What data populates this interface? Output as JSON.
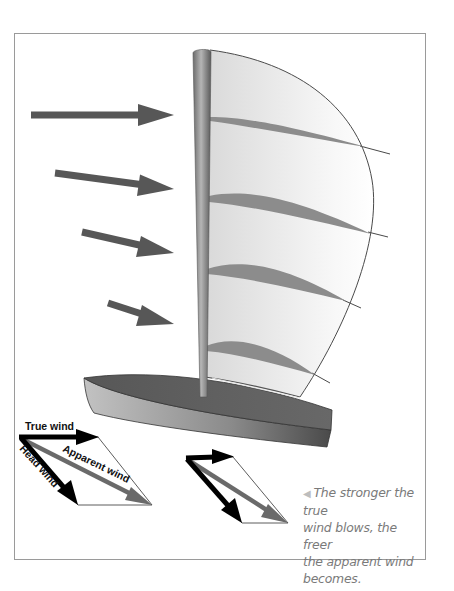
{
  "figure": {
    "colors": {
      "wind_arrow": "#575757",
      "mast": "#8a8a8a",
      "sail": "#e6e6e6",
      "batten": "#8c8c8c",
      "hull_deck": "#5e5e5e",
      "hull_side": "#9e9e9e",
      "true_wind": "#000000",
      "apparent_wind": "#6a6a6a",
      "frame": "#9a9a9a"
    },
    "wind_arrows": [
      {
        "from": [
          31,
          115
        ],
        "to": [
          174,
          115
        ]
      },
      {
        "from": [
          55,
          173
        ],
        "to": [
          174,
          189
        ]
      },
      {
        "from": [
          82,
          232
        ],
        "to": [
          174,
          253
        ]
      },
      {
        "from": [
          108,
          303
        ],
        "to": [
          174,
          324
        ]
      }
    ],
    "vector_diagram_1": {
      "labels": {
        "true_wind": "True wind",
        "apparent_wind": "Apparent wind",
        "head_wind": "Head wind"
      }
    },
    "vector_diagram_2": {
      "labels": {}
    },
    "caption": {
      "marker": "◀",
      "lines": [
        "The stronger the true",
        "wind blows, the freer",
        "the apparent wind",
        "becomes."
      ]
    }
  }
}
